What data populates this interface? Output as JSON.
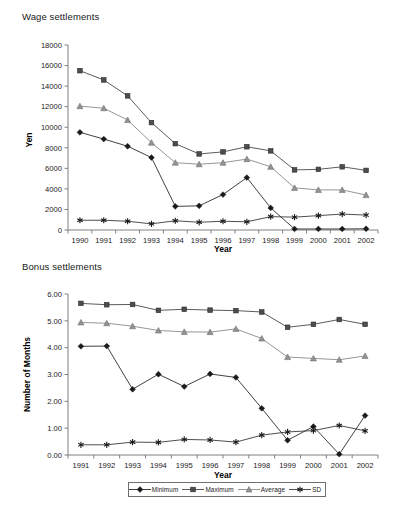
{
  "figure": {
    "background_color": "#ffffff",
    "panels": [
      {
        "id": "wage",
        "title": "Wage settlements"
      },
      {
        "id": "bonus",
        "title": "Bonus settlements"
      }
    ]
  },
  "legend": {
    "position": "bottom-center",
    "entries": [
      {
        "label": "Minimum",
        "marker": "diamond-marker",
        "color": "#1a1a1a"
      },
      {
        "label": "Maximum",
        "marker": "square-marker",
        "color": "#4d4d4d"
      },
      {
        "label": "Average",
        "marker": "triangle-marker",
        "color": "#939393"
      },
      {
        "label": "SD",
        "marker": "asterisk-marker",
        "color": "#1a1a1a"
      }
    ]
  },
  "chart_data": [
    {
      "id": "wage",
      "type": "line",
      "title": "Wage settlements",
      "xlabel": "Year",
      "ylabel": "Yen",
      "categories": [
        "1990",
        "1991",
        "1992",
        "1993",
        "1994",
        "1995",
        "1996",
        "1997",
        "1998",
        "1999",
        "2000",
        "2001",
        "2002"
      ],
      "x": [
        1990,
        1991,
        1992,
        1993,
        1994,
        1995,
        1996,
        1997,
        1998,
        1999,
        2000,
        2001,
        2002
      ],
      "xlim": [
        1989.5,
        2002.5
      ],
      "ylim": [
        0,
        18000
      ],
      "yticks": [
        0,
        2000,
        4000,
        6000,
        8000,
        10000,
        12000,
        14000,
        16000,
        18000
      ],
      "ytick_labels": [
        "0",
        "2000",
        "4000",
        "6000",
        "8000",
        "10000",
        "12000",
        "14000",
        "16000",
        "18000"
      ],
      "grid": false,
      "legend_position": "bottom-center",
      "series": [
        {
          "name": "Minimum",
          "marker": "diamond-marker",
          "color": "#1a1a1a",
          "values": [
            9500,
            8850,
            8150,
            7050,
            2300,
            2350,
            3450,
            5100,
            2150,
            100,
            100,
            100,
            120
          ]
        },
        {
          "name": "Maximum",
          "marker": "square-marker",
          "color": "#4d4d4d",
          "values": [
            15500,
            14600,
            13050,
            10450,
            8400,
            7400,
            7600,
            8100,
            7700,
            5850,
            5900,
            6150,
            5800
          ]
        },
        {
          "name": "Average",
          "marker": "triangle-marker",
          "color": "#939393",
          "values": [
            12050,
            11850,
            10700,
            8500,
            6550,
            6400,
            6550,
            6900,
            6150,
            4100,
            3900,
            3900,
            3400
          ]
        },
        {
          "name": "SD",
          "marker": "asterisk-marker",
          "color": "#1a1a1a",
          "values": [
            950,
            950,
            850,
            600,
            900,
            750,
            850,
            800,
            1300,
            1250,
            1400,
            1550,
            1450
          ]
        }
      ]
    },
    {
      "id": "bonus",
      "type": "line",
      "title": "Bonus settlements",
      "xlabel": "Year",
      "ylabel": "Number of Months",
      "categories": [
        "1991",
        "1992",
        "1993",
        "1994",
        "1995",
        "1996",
        "1997",
        "1998",
        "1999",
        "2000",
        "2001",
        "2002"
      ],
      "x": [
        1991,
        1992,
        1993,
        1994,
        1995,
        1996,
        1997,
        1998,
        1999,
        2000,
        2001,
        2002
      ],
      "xlim": [
        1990.5,
        2002.5
      ],
      "ylim": [
        0.0,
        6.0
      ],
      "yticks": [
        0.0,
        1.0,
        2.0,
        3.0,
        4.0,
        5.0,
        6.0
      ],
      "ytick_labels": [
        "0.00",
        "1.00",
        "2.00",
        "3.00",
        "4.00",
        "5.00",
        "6.00"
      ],
      "grid": false,
      "legend_position": "bottom-center",
      "series": [
        {
          "name": "Minimum",
          "marker": "diamond-marker",
          "color": "#1a1a1a",
          "values": [
            4.05,
            4.06,
            2.45,
            3.01,
            2.55,
            3.02,
            2.89,
            1.74,
            0.55,
            1.06,
            0.03,
            1.47
          ]
        },
        {
          "name": "Maximum",
          "marker": "square-marker",
          "color": "#4d4d4d",
          "values": [
            5.65,
            5.6,
            5.61,
            5.39,
            5.43,
            5.4,
            5.38,
            5.33,
            4.76,
            4.87,
            5.05,
            4.87
          ]
        },
        {
          "name": "Average",
          "marker": "triangle-marker",
          "color": "#939393",
          "values": [
            4.94,
            4.91,
            4.8,
            4.64,
            4.59,
            4.58,
            4.7,
            4.34,
            3.65,
            3.6,
            3.55,
            3.69
          ]
        },
        {
          "name": "SD",
          "marker": "asterisk-marker",
          "color": "#1a1a1a",
          "values": [
            0.38,
            0.38,
            0.48,
            0.47,
            0.58,
            0.56,
            0.48,
            0.74,
            0.86,
            0.91,
            1.1,
            0.9
          ]
        }
      ]
    }
  ]
}
